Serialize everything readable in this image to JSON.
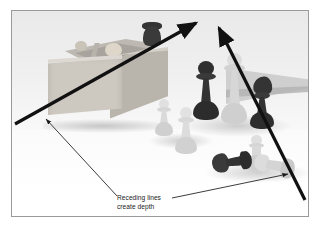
{
  "figure": {
    "kind": "annotated-photograph",
    "caption_lines": [
      "Receding lines",
      "create depth"
    ],
    "frame": {
      "border_color": "#9a9a9a",
      "background_color": "#ffffff"
    },
    "annotation": {
      "line_color": "#111111",
      "leader_color": "#1a1a1a",
      "receding_line_left_label": "receding-line-left",
      "receding_line_right_label": "receding-line-right"
    },
    "scene": {
      "description": "Grayscale studio photo of chess pieces beside an open cardboard box",
      "objects": [
        {
          "name": "cardboard-box",
          "tone": "light-gray"
        },
        {
          "name": "flat-board-slab",
          "tone": "mid-gray"
        },
        {
          "name": "dark-queen",
          "tone": "black"
        },
        {
          "name": "white-queen",
          "tone": "white"
        },
        {
          "name": "dark-knight",
          "tone": "black"
        },
        {
          "name": "white-pawn-front",
          "tone": "white"
        },
        {
          "name": "white-pawn-left",
          "tone": "white"
        },
        {
          "name": "white-pawn-back",
          "tone": "white"
        },
        {
          "name": "fallen-dark-piece",
          "tone": "black"
        },
        {
          "name": "fallen-white-piece",
          "tone": "white"
        }
      ]
    }
  }
}
